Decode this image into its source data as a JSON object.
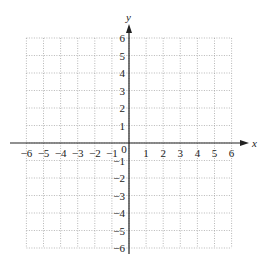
{
  "chart_data": {
    "type": "scatter",
    "title": "",
    "xlabel": "x",
    "ylabel": "y",
    "xlim": [
      -6,
      6
    ],
    "ylim": [
      -6,
      6
    ],
    "grid": true,
    "grid_style": "dotted",
    "x_ticks": [
      "-6",
      "-5",
      "-4",
      "-3",
      "-2",
      "-1",
      "0",
      "1",
      "2",
      "3",
      "4",
      "5",
      "6"
    ],
    "y_ticks": [
      "6",
      "5",
      "4",
      "3",
      "2",
      "1",
      "-1",
      "-2",
      "-3",
      "-4",
      "-5",
      "-6"
    ],
    "series": [],
    "origin_label": "0"
  },
  "colors": {
    "grid": "#9a9a9a",
    "axis": "#222222"
  }
}
